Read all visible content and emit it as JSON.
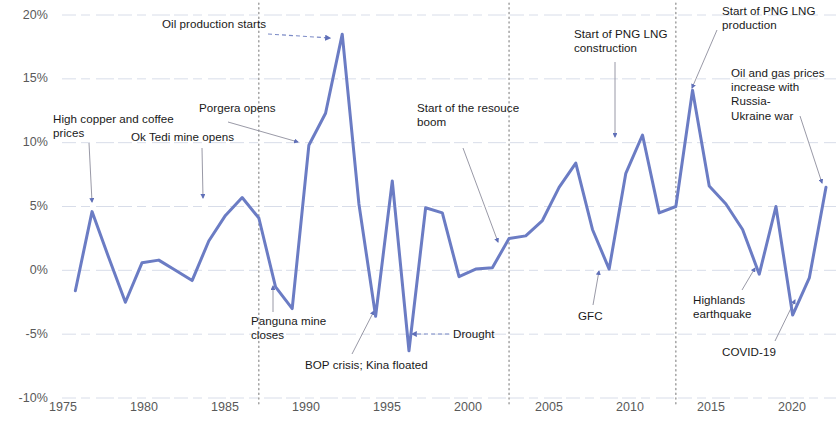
{
  "chart_data": {
    "type": "line",
    "title": "",
    "subtitle": "",
    "xlabel": "",
    "ylabel": "",
    "grid": true,
    "legend_position": "none",
    "xlim": [
      1975,
      2022
    ],
    "ylim": [
      -10,
      20
    ],
    "ytick_labels": [
      "20%",
      "15%",
      "10%",
      "5%",
      "0%",
      "-5%",
      "-10%"
    ],
    "ytick_values": [
      20,
      15,
      10,
      5,
      0,
      -5,
      -10
    ],
    "xtick_labels": [
      "1975",
      "1980",
      "1985",
      "1990",
      "1995",
      "2000",
      "2005",
      "2010",
      "2015",
      "2020"
    ],
    "xtick_values": [
      1975,
      1980,
      1985,
      1990,
      1995,
      2000,
      2005,
      2010,
      2015,
      2020
    ],
    "series_name": "Real GDP growth",
    "line_color": "#6b7cc4",
    "x": [
      1977,
      1978,
      1979,
      1980,
      1981,
      1982,
      1983,
      1984,
      1985,
      1986,
      1987,
      1988,
      1989,
      1990,
      1991,
      1992,
      1993,
      1994,
      1995,
      1996,
      1997,
      1998,
      1999,
      2000,
      2001,
      2002,
      2003,
      2004,
      2005,
      2006,
      2007,
      2008,
      2009,
      2010,
      2011,
      2012,
      2013,
      2014,
      2015,
      2016,
      2017,
      2018,
      2019,
      2020,
      2021,
      2022
    ],
    "values": [
      -1.6,
      4.6,
      1.0,
      -2.5,
      0.6,
      0.8,
      0.0,
      -0.8,
      2.3,
      4.3,
      5.7,
      4.1,
      -1.3,
      -3.0,
      9.8,
      12.3,
      18.5,
      5.2,
      -3.6,
      7.0,
      -6.3,
      4.9,
      4.5,
      -0.5,
      0.1,
      0.2,
      2.5,
      2.7,
      3.9,
      6.5,
      8.4,
      3.2,
      0.1,
      7.6,
      10.6,
      4.5,
      5.0,
      14.1,
      6.6,
      5.2,
      3.2,
      -0.3,
      5.0,
      -3.5,
      -0.6,
      6.5
    ],
    "event_markers": [
      {
        "label": "1988",
        "x": 1988
      },
      {
        "label": "2003",
        "x": 2003
      },
      {
        "label": "2013",
        "x": 2013
      }
    ],
    "annotations": [
      {
        "id": "oil-production-starts",
        "text": "Oil production starts",
        "target_x": 1993,
        "target_y": 18.5
      },
      {
        "id": "high-copper-coffee",
        "text": "High copper and coffee prices",
        "target_x": 1978,
        "target_y": 4.6
      },
      {
        "id": "ok-tedi",
        "text": "Ok Tedi mine opens",
        "target_x": 1985,
        "target_y": 2.3
      },
      {
        "id": "porgera-opens",
        "text": "Porgera opens",
        "target_x": 1992,
        "target_y": 12.3
      },
      {
        "id": "panguna-closes",
        "text": "Panguna mine closes",
        "target_x": 1989,
        "target_y": -1.3
      },
      {
        "id": "bop-crisis",
        "text": "BOP crisis; Kina floated",
        "target_x": 1995,
        "target_y": -3.6
      },
      {
        "id": "drought",
        "text": "Drought",
        "target_x": 1997,
        "target_y": -6.3
      },
      {
        "id": "resource-boom",
        "text": "Start of the resouce boom",
        "target_x": 2003,
        "target_y": 2.5
      },
      {
        "id": "gfc",
        "text": "GFC",
        "target_x": 2009,
        "target_y": 0.1
      },
      {
        "id": "png-lng-construction",
        "text": "Start of PNG LNG construction",
        "target_x": 2010,
        "target_y": 10.6
      },
      {
        "id": "png-lng-production",
        "text": "Start of PNG LNG production",
        "target_x": 2014,
        "target_y": 14.1
      },
      {
        "id": "russia-ukraine",
        "text": "Oil and gas prices increase with Russia-Ukraine war",
        "target_x": 2022,
        "target_y": 6.5
      },
      {
        "id": "highlands-earthquake",
        "text": "Highlands earthquake",
        "target_x": 2018,
        "target_y": -0.3
      },
      {
        "id": "covid-19",
        "text": "COVID-19",
        "target_x": 2020,
        "target_y": -3.5
      }
    ]
  },
  "axes": {
    "y_ticks": [
      {
        "label": "20%",
        "top": 8
      },
      {
        "label": "15%",
        "top": 71
      },
      {
        "label": "10%",
        "top": 135
      },
      {
        "label": "5%",
        "top": 199
      },
      {
        "label": "0%",
        "top": 263
      },
      {
        "label": "-5%",
        "top": 327
      },
      {
        "label": "-10%",
        "top": 391
      }
    ],
    "x_ticks": [
      {
        "label": "1975",
        "left": 33
      },
      {
        "label": "1980",
        "left": 114
      },
      {
        "label": "1985",
        "left": 195
      },
      {
        "label": "1990",
        "left": 276
      },
      {
        "label": "1995",
        "left": 357
      },
      {
        "label": "2000",
        "left": 438
      },
      {
        "label": "2005",
        "left": 519
      },
      {
        "label": "2010",
        "left": 600
      },
      {
        "label": "2015",
        "left": 681
      },
      {
        "label": "2020",
        "left": 762
      }
    ]
  },
  "annotation_labels": [
    {
      "id": "oil-production-starts",
      "text": "Oil production starts",
      "left": 162,
      "top": 17,
      "width": 140
    },
    {
      "id": "high-copper-coffee",
      "text": "High copper and coffee\nprices",
      "left": 53,
      "top": 112,
      "width": 130
    },
    {
      "id": "ok-tedi",
      "text": "Ok Tedi mine opens",
      "left": 131,
      "top": 130,
      "width": 120
    },
    {
      "id": "porgera-opens",
      "text": "Porgera opens",
      "left": 199,
      "top": 101,
      "width": 100
    },
    {
      "id": "panguna-closes",
      "text": "Panguna mine\ncloses",
      "left": 251,
      "top": 314,
      "width": 92
    },
    {
      "id": "bop-crisis",
      "text": "BOP crisis; Kina floated",
      "left": 305,
      "top": 358,
      "width": 150
    },
    {
      "id": "drought",
      "text": "Drought",
      "left": 453,
      "top": 327,
      "width": 60
    },
    {
      "id": "resource-boom",
      "text": "Start of the resouce\nboom",
      "left": 417,
      "top": 101,
      "width": 130
    },
    {
      "id": "gfc",
      "text": "GFC",
      "left": 578,
      "top": 309,
      "width": 40
    },
    {
      "id": "png-lng-construction",
      "text": "Start of PNG LNG\nconstruction",
      "left": 574,
      "top": 27,
      "width": 115
    },
    {
      "id": "png-lng-production",
      "text": "Start of PNG LNG\nproduction",
      "left": 722,
      "top": 4,
      "width": 112
    },
    {
      "id": "russia-ukraine",
      "text": "Oil and gas prices\nincrease with Russia-\nUkraine war",
      "left": 731,
      "top": 66,
      "width": 106
    },
    {
      "id": "highlands-earthquake",
      "text": "Highlands\nearthquake",
      "left": 693,
      "top": 293,
      "width": 80
    },
    {
      "id": "covid-19",
      "text": "COVID-19",
      "left": 722,
      "top": 345,
      "width": 70
    }
  ],
  "arrows": [
    {
      "id": "arrow-oil-production-starts",
      "x1": 268,
      "y1": 34,
      "x2": 330,
      "y2": 38,
      "style": "dashed",
      "head": true
    },
    {
      "id": "arrow-high-copper-coffee",
      "x1": 89,
      "y1": 143,
      "x2": 92,
      "y2": 202,
      "style": "solid",
      "head": true
    },
    {
      "id": "arrow-ok-tedi",
      "x1": 202,
      "y1": 148,
      "x2": 203,
      "y2": 198,
      "style": "solid",
      "head": true
    },
    {
      "id": "arrow-porgera-opens",
      "x1": 228,
      "y1": 122,
      "x2": 298,
      "y2": 142,
      "style": "solid",
      "head": true
    },
    {
      "id": "arrow-panguna-closes",
      "x1": 273,
      "y1": 312,
      "x2": 273,
      "y2": 286,
      "style": "solid",
      "head": true
    },
    {
      "id": "arrow-bop-crisis",
      "x1": 352,
      "y1": 354,
      "x2": 374,
      "y2": 311,
      "style": "solid",
      "head": true
    },
    {
      "id": "arrow-drought",
      "x1": 449,
      "y1": 334,
      "x2": 412,
      "y2": 334,
      "style": "dashed",
      "head": true
    },
    {
      "id": "arrow-resource-boom",
      "x1": 463,
      "y1": 148,
      "x2": 498,
      "y2": 242,
      "style": "solid",
      "head": true
    },
    {
      "id": "arrow-gfc",
      "x1": 593,
      "y1": 305,
      "x2": 599,
      "y2": 271,
      "style": "solid",
      "head": true
    },
    {
      "id": "arrow-png-lng-construction",
      "x1": 615,
      "y1": 62,
      "x2": 615,
      "y2": 137,
      "style": "solid",
      "head": true
    },
    {
      "id": "arrow-png-lng-production",
      "x1": 717,
      "y1": 30,
      "x2": 692,
      "y2": 88,
      "style": "solid",
      "head": true
    },
    {
      "id": "arrow-russia-ukraine",
      "x1": 800,
      "y1": 116,
      "x2": 822,
      "y2": 183,
      "style": "solid",
      "head": true
    },
    {
      "id": "arrow-highlands-earthquake",
      "x1": 742,
      "y1": 290,
      "x2": 755,
      "y2": 268,
      "style": "solid",
      "head": true
    },
    {
      "id": "arrow-covid-19",
      "x1": 775,
      "y1": 341,
      "x2": 795,
      "y2": 300,
      "style": "solid",
      "head": true
    }
  ]
}
